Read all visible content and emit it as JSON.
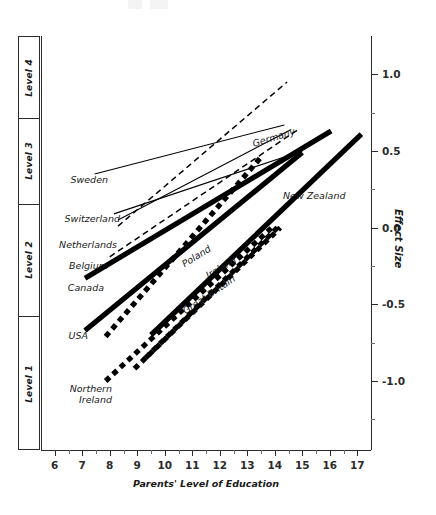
{
  "chart_data": {
    "type": "line",
    "title": "",
    "xlabel": "Parents' Level of Education",
    "ylabel": "Effect Size",
    "xlim": [
      5.5,
      17.5
    ],
    "ylim": [
      -1.45,
      1.25
    ],
    "grid": false,
    "legend_position": "inline-labels",
    "x_ticks": [
      6,
      7,
      8,
      9,
      10,
      11,
      12,
      13,
      14,
      15,
      16,
      17
    ],
    "x_tick_labels": [
      "6",
      "7",
      "8",
      "9",
      "10",
      "11",
      "12",
      "13",
      "14",
      "15",
      "16",
      "17"
    ],
    "y_ticks": [
      -1.0,
      -0.5,
      0.0,
      0.5,
      1.0
    ],
    "y_tick_labels": [
      "-1.0",
      "-0.5",
      "0.0",
      "0.5",
      "1.0"
    ],
    "y_minor_ticks": [
      -1.25,
      -0.75,
      -0.25,
      0.25,
      0.75
    ],
    "left_axis_label": "Level",
    "level_bands": [
      {
        "label": "Level 4",
        "y_from": 0.72,
        "y_to": 1.25
      },
      {
        "label": "Level 3",
        "y_from": 0.16,
        "y_to": 0.72
      },
      {
        "label": "Level 2",
        "y_from": -0.57,
        "y_to": 0.16
      },
      {
        "label": "Level 1",
        "y_from": -1.45,
        "y_to": -0.57
      }
    ],
    "series": [
      {
        "name": "Sweden",
        "style": "thin-solid",
        "label_side": "left",
        "points": [
          [
            7.45,
            0.35
          ],
          [
            14.35,
            0.67
          ]
        ]
      },
      {
        "name": "Switzerland",
        "style": "thin-solid",
        "label_side": "left",
        "points": [
          [
            8.15,
            0.09
          ],
          [
            15.0,
            0.5
          ]
        ]
      },
      {
        "name": "Netherlands",
        "style": "thin-dashed",
        "label_side": "left",
        "points": [
          [
            8.3,
            0.01
          ],
          [
            14.45,
            0.95
          ]
        ]
      },
      {
        "name": "Belgium",
        "style": "thin-dashed",
        "label_side": "left",
        "points": [
          [
            8.0,
            -0.19
          ],
          [
            14.85,
            0.64
          ]
        ]
      },
      {
        "name": "Canada",
        "style": "thick-solid",
        "label_side": "left",
        "points": [
          [
            7.1,
            -0.33
          ],
          [
            16.05,
            0.63
          ]
        ]
      },
      {
        "name": "USA",
        "style": "thick-solid",
        "label_side": "left",
        "points": [
          [
            7.1,
            -0.67
          ],
          [
            15.0,
            0.49
          ]
        ]
      },
      {
        "name": "Northern Ireland",
        "style": "thick-dotted",
        "label_side": "left",
        "points": [
          [
            7.85,
            -1.0
          ],
          [
            13.95,
            0.01
          ]
        ]
      },
      {
        "name": "Germany",
        "style": "thin-solid",
        "label_side": "inline",
        "label_x": 13.2,
        "label_y": 0.58,
        "label_angle": -17,
        "points": [
          [
            8.3,
            0.05
          ],
          [
            14.6,
            0.64
          ]
        ]
      },
      {
        "name": "Poland",
        "style": "thick-dotted",
        "label_side": "inline",
        "label_x": 10.65,
        "label_y": -0.21,
        "label_angle": -32,
        "points": [
          [
            7.85,
            -0.71
          ],
          [
            13.55,
            0.47
          ]
        ]
      },
      {
        "name": "Ireland",
        "style": "thick-dotted",
        "label_side": "inline",
        "label_x": 11.55,
        "label_y": -0.28,
        "label_angle": -30,
        "points": [
          [
            9.3,
            -0.85
          ],
          [
            14.15,
            0.01
          ]
        ]
      },
      {
        "name": "Great Britain",
        "style": "thick-dotted",
        "label_side": "inline",
        "label_x": 10.7,
        "label_y": -0.52,
        "label_angle": -34,
        "points": [
          [
            8.9,
            -0.92
          ],
          [
            14.2,
            0.0
          ]
        ]
      },
      {
        "name": "New Zealand",
        "style": "thick-solid",
        "label_side": "right",
        "label_x": 14.3,
        "label_y": 0.2,
        "points": [
          [
            9.5,
            -0.7
          ],
          [
            17.15,
            0.61
          ]
        ]
      }
    ]
  },
  "axes": {
    "effect_size_title": "Effect Size",
    "education_title": "Parents' Level of Education"
  },
  "colors": {
    "axis": "#2b2b2b",
    "line": "#000000",
    "text": "#1a1a1a",
    "background": "#ffffff"
  }
}
